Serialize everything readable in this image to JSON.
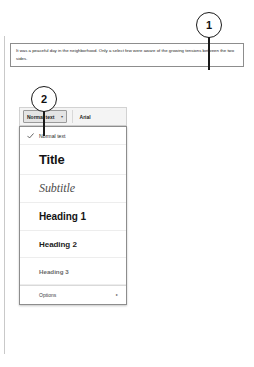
{
  "document": {
    "paragraph": "It was a peaceful day in the neighborhood. Only a select few were aware of the growing tensions between the two sides.",
    "background_fragments": [
      "t",
      "w",
      "r",
      "f",
      "c"
    ]
  },
  "toolbar": {
    "style_selector": {
      "label": "Normal text",
      "caret": "▾"
    },
    "font_selector": {
      "label": "Arial"
    }
  },
  "style_menu": {
    "items": [
      {
        "label": "Normal text",
        "checked": true
      },
      {
        "label": "Title",
        "checked": false
      },
      {
        "label": "Subtitle",
        "checked": false
      },
      {
        "label": "Heading 1",
        "checked": false
      },
      {
        "label": "Heading 2",
        "checked": false
      },
      {
        "label": "Heading 3",
        "checked": false
      },
      {
        "label": "Options",
        "checked": false,
        "submenu_caret": "▸"
      }
    ]
  },
  "callouts": [
    {
      "number": "1"
    },
    {
      "number": "2"
    }
  ],
  "colors": {
    "text": "#1a1a1a",
    "muted": "#6a6a6a",
    "border": "#8d8d8d",
    "toolbar_bg": "#f4f4f4",
    "callout": "#1a1a1a"
  }
}
